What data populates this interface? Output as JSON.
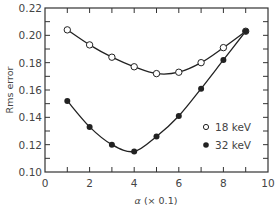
{
  "chart_data": {
    "type": "line",
    "title": "",
    "xlabel": "α (× 0.1)",
    "ylabel": "Rms error",
    "xlim": [
      0,
      10
    ],
    "ylim": [
      0.1,
      0.22
    ],
    "x_ticks": [
      "0",
      "2",
      "4",
      "6",
      "8",
      "10"
    ],
    "y_ticks": [
      "0.10",
      "0.12",
      "0.14",
      "0.16",
      "0.18",
      "0.20",
      "0.22"
    ],
    "grid": false,
    "legend_position": "lower right (inside)",
    "x": [
      1,
      2,
      3,
      4,
      5,
      6,
      7,
      8,
      9
    ],
    "series": [
      {
        "name": "18 keV",
        "marker": "open-circle",
        "values": [
          0.204,
          0.193,
          0.184,
          0.177,
          0.172,
          0.173,
          0.18,
          0.191,
          0.203
        ]
      },
      {
        "name": "32 keV",
        "marker": "filled-circle",
        "values": [
          0.152,
          0.133,
          0.12,
          0.115,
          0.126,
          0.141,
          0.161,
          0.182,
          0.203
        ]
      }
    ]
  },
  "legend": {
    "items": [
      {
        "label": "18 keV",
        "marker": "open-circle"
      },
      {
        "label": "32 keV",
        "marker": "filled-circle"
      }
    ]
  },
  "colors": {
    "line": "#222222",
    "axis": "#333333",
    "text": "#444444",
    "background": "#ffffff"
  }
}
